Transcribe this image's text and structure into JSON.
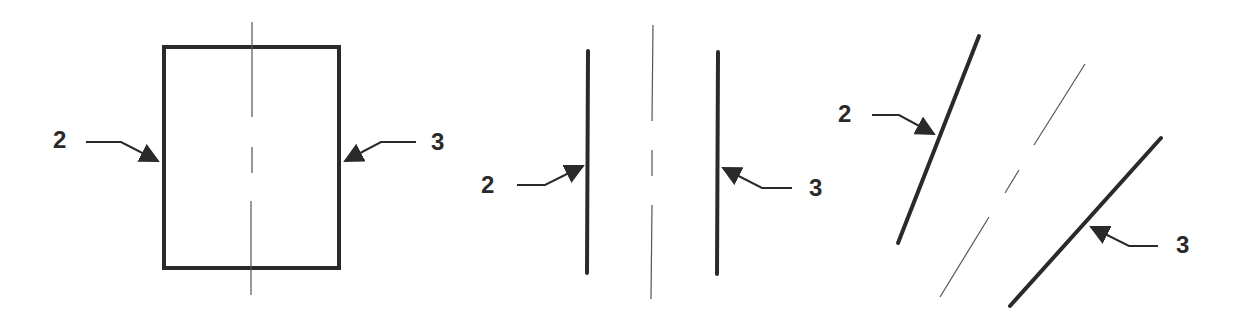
{
  "figures": [
    {
      "name": "rectangle-view",
      "labels": [
        {
          "text": "2",
          "x": 53,
          "y": 148,
          "target": "left-edge"
        },
        {
          "text": "3",
          "x": 431,
          "y": 150,
          "target": "right-edge"
        }
      ]
    },
    {
      "name": "parallel-lines-view",
      "labels": [
        {
          "text": "2",
          "x": 481,
          "y": 193,
          "target": "left-line"
        },
        {
          "text": "3",
          "x": 809,
          "y": 196,
          "target": "right-line"
        }
      ]
    },
    {
      "name": "inclined-lines-view",
      "labels": [
        {
          "text": "2",
          "x": 838,
          "y": 122,
          "target": "upper-left-line"
        },
        {
          "text": "3",
          "x": 1176,
          "y": 253,
          "target": "lower-right-line"
        }
      ]
    }
  ],
  "colors": {
    "line": "#2a2a2a",
    "centerline": "#555555",
    "background": "#ffffff"
  }
}
